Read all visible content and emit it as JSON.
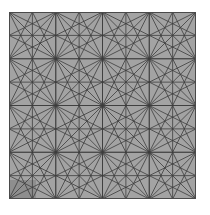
{
  "image": {
    "description": "Grey square tile with a repeating geometric star line pattern",
    "background": "#ffffff"
  },
  "pattern": {
    "x": 9,
    "y": 12,
    "size": 187,
    "rows": 4,
    "cols": 4,
    "fill": "#a3a3a3",
    "line_color": "#3c3c3c",
    "line_width": 0.8,
    "border_color": "#4a4a4a",
    "motif": "eight-line star: midlines, diagonals, corner-to-opposite-edge-midpoint lines",
    "shade_patch": {
      "x": 0,
      "y": 168,
      "width": 27,
      "height": 19,
      "color": "#8e8e8e"
    }
  }
}
